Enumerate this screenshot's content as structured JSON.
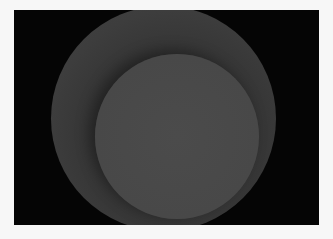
{
  "image": {
    "description": "Two overlapping gray circles on a black background inside a white frame",
    "colors": {
      "frame": "#f7f7f7",
      "background": "#050505",
      "outer_circle": "#3c3c3c",
      "inner_circle": "#4a4a4a"
    },
    "shapes": [
      {
        "name": "outer-circle",
        "cx": 163.5,
        "cy": 118,
        "r": 112.5
      },
      {
        "name": "inner-circle",
        "cx": 177,
        "cy": 136.5,
        "r": 82
      }
    ]
  }
}
